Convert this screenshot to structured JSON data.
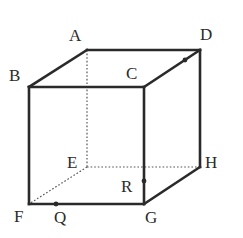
{
  "diagram": {
    "type": "cube",
    "colors": {
      "line": "#2a2a2a",
      "hidden_line": "#555555",
      "background": "#ffffff"
    },
    "vertices": {
      "A": {
        "label": "A",
        "x": 87,
        "y": 50
      },
      "B": {
        "label": "B",
        "x": 29,
        "y": 87
      },
      "C": {
        "label": "C",
        "x": 144,
        "y": 87
      },
      "D": {
        "label": "D",
        "x": 200,
        "y": 50
      },
      "E": {
        "label": "E",
        "x": 87,
        "y": 167
      },
      "F": {
        "label": "F",
        "x": 29,
        "y": 204
      },
      "G": {
        "label": "G",
        "x": 144,
        "y": 204
      },
      "H": {
        "label": "H",
        "x": 200,
        "y": 167
      }
    },
    "points": {
      "P": {
        "label": "",
        "on_edge": "CD",
        "x": 185,
        "y": 60
      },
      "Q": {
        "label": "Q",
        "on_edge": "FG",
        "x": 56,
        "y": 204
      },
      "R": {
        "label": "R",
        "on_edge": "CG",
        "x": 144,
        "y": 181
      }
    },
    "visible_edges": [
      "AB",
      "AD",
      "BC",
      "CD",
      "BF",
      "CG",
      "DH",
      "FG",
      "GH"
    ],
    "hidden_edges": [
      "AE",
      "EF",
      "EH"
    ]
  }
}
